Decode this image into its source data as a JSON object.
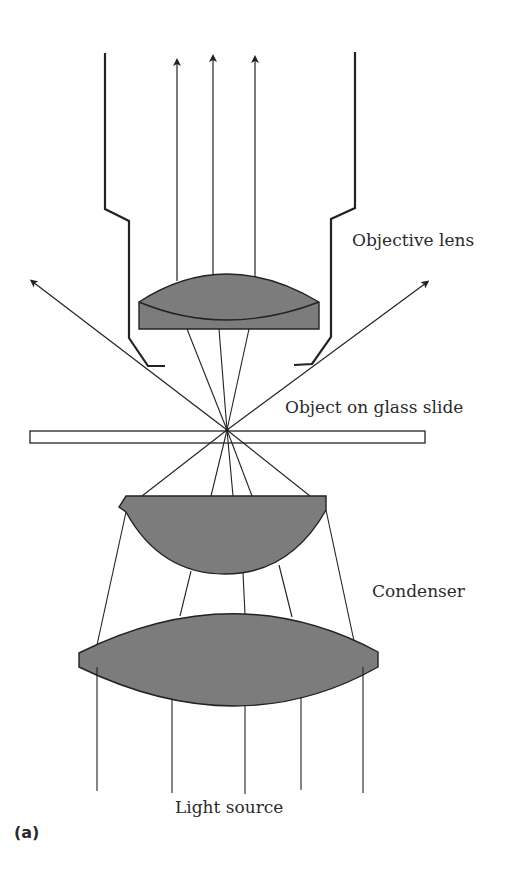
{
  "figure": {
    "panel_label": "(a)",
    "colors": {
      "lens_fill": "#7c7c7c",
      "stroke": "#222222",
      "background": "#ffffff"
    },
    "labels": {
      "objective": "Objective lens",
      "slide": "Object on glass slide",
      "condenser": "Condenser",
      "light_source": "Light source"
    },
    "components": [
      {
        "name": "Objective lens housing",
        "type": "tube"
      },
      {
        "name": "Objective lens",
        "type": "plano-convex lens"
      },
      {
        "name": "Glass slide",
        "type": "slide"
      },
      {
        "name": "Condenser upper lens",
        "type": "hemispherical lens"
      },
      {
        "name": "Condenser lower lens",
        "type": "biconvex lens"
      },
      {
        "name": "Light rays",
        "type": "rays",
        "count_below_condenser": 5,
        "count_above_objective": 3,
        "diffracted_arrows": 2
      }
    ]
  }
}
